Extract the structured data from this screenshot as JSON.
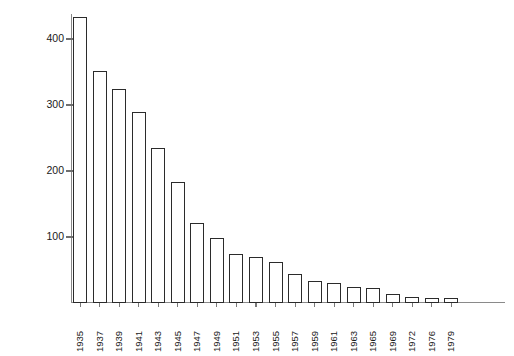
{
  "chart_data": {
    "type": "bar",
    "title": "",
    "subtitle": "",
    "xlabel": "",
    "ylabel": "Mortality rate",
    "ylim": [
      0,
      450
    ],
    "yticks": [
      100,
      200,
      300,
      400
    ],
    "ytick_labels": [
      "100",
      "200",
      "300",
      "400"
    ],
    "grid": false,
    "legend": "none",
    "orientation": "vertical",
    "bar_style": {
      "fill": "#ffffff",
      "edge": "#2b2b2b",
      "edge_width_px": 1.3
    },
    "axis_color": "#8a8a8a",
    "categories": [
      "1935",
      "1937",
      "1939",
      "1941",
      "1943",
      "1945",
      "1947",
      "1949",
      "1951",
      "1953",
      "1955",
      "1957",
      "1959",
      "1961",
      "1963",
      "1965",
      "1969",
      "1972",
      "1976",
      "1979"
    ],
    "values": [
      433,
      352,
      325,
      290,
      235,
      184,
      121,
      99,
      75,
      70,
      62,
      44,
      33,
      30,
      24,
      22,
      14,
      9,
      8,
      7
    ],
    "series": [
      {
        "name": "Mortality rate",
        "values": [
          433,
          352,
          325,
          290,
          235,
          184,
          121,
          99,
          75,
          70,
          62,
          44,
          33,
          30,
          24,
          22,
          14,
          9,
          8,
          7
        ]
      }
    ]
  },
  "axis": {
    "y_label_text": "Mortality rate"
  }
}
